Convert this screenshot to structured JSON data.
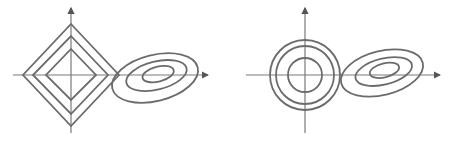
{
  "figure": {
    "stroke_color": "#6b6b6b",
    "axis_color": "#7a7a7a",
    "panels": [
      {
        "name": "l1-panel",
        "constraint_shape": "diamond",
        "origin": [
          71,
          75
        ],
        "diamond_half_widths": [
          48,
          38,
          25
        ],
        "ellipse_center": [
          155,
          77
        ],
        "ellipse_radii": [
          [
            45,
            24
          ],
          [
            32,
            15
          ],
          [
            17,
            8
          ]
        ],
        "ellipse_rotation": -15
      },
      {
        "name": "l2-panel",
        "constraint_shape": "circle",
        "origin": [
          305,
          75
        ],
        "circle_radii": [
          35,
          29,
          17
        ],
        "ellipse_center": [
          381,
          72
        ],
        "ellipse_radii": [
          [
            42,
            22
          ],
          [
            30,
            14
          ],
          [
            16,
            8
          ]
        ],
        "ellipse_rotation": -15
      }
    ]
  }
}
